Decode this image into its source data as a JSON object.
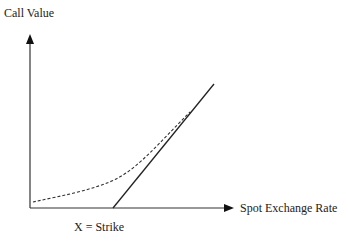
{
  "diagram": {
    "y_axis_label": "Call Value",
    "x_axis_label": "Spot Exchange Rate",
    "strike_label": "X = Strike",
    "series": [
      {
        "name": "intrinsic-value",
        "style": "solid",
        "description": "Payoff at expiry: zero below strike, rising linearly above strike"
      },
      {
        "name": "option-value-before-expiry",
        "style": "dashed",
        "description": "Call value curve above intrinsic value, converging at high spot rates"
      }
    ],
    "colors": {
      "line": "#222222",
      "background": "#ffffff"
    }
  }
}
